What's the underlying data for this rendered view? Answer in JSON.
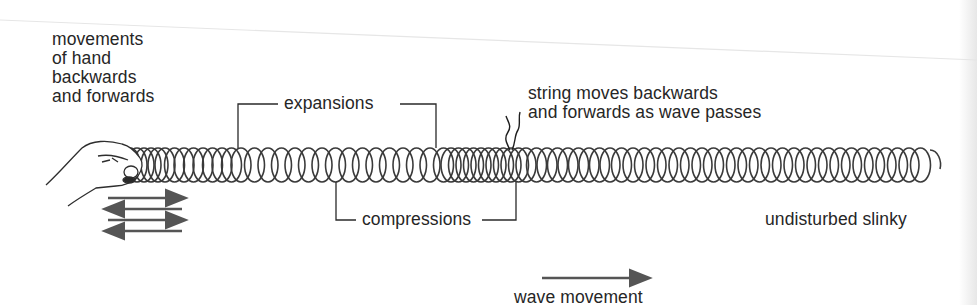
{
  "diagram": {
    "labels": {
      "hand_movement": "movements\nof hand\nbackwards\nand forwards",
      "expansions": "expansions",
      "compressions": "compressions",
      "string_note": "string moves backwards\nand forwards as wave passes",
      "undisturbed": "undisturbed slinky",
      "wave_movement": "wave movement"
    },
    "elements": {
      "hand": "hand-icon",
      "slinky": "coil-spring",
      "string": "string-marker",
      "hand_arrows": [
        "arrow-right",
        "arrow-left",
        "arrow-right",
        "arrow-left"
      ],
      "wave_arrow": "arrow-right"
    },
    "colors": {
      "ink": "#2a2a2a",
      "coil": "#3a3a3a",
      "arrow": "#555555",
      "background": "#ffffff"
    }
  }
}
